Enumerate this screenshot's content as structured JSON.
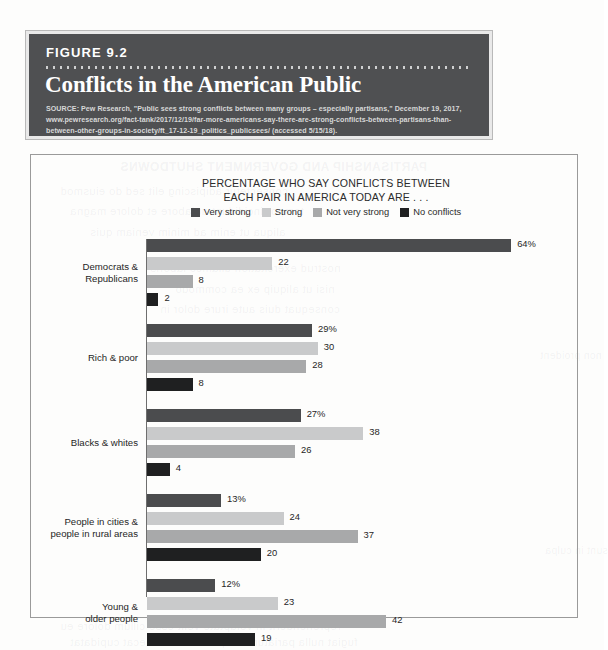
{
  "figure": {
    "number": "FIGURE 9.2",
    "title": "Conflicts in the American Public",
    "source": "SOURCE: Pew Research, \"Public sees strong conflicts between many groups – especially partisans,\" December 19, 2017, www.pewresearch.org/fact-tank/2017/12/19/far-more-americans-say-there-are-strong-conflicts-between-partisans-than-between-other-groups-in-society/ft_17-12-19_politics_publicsees/ (accessed 5/15/18)."
  },
  "chart_data": {
    "type": "bar",
    "orientation": "horizontal",
    "title": "PERCENTAGE WHO SAY CONFLICTS BETWEEN EACH PAIR IN AMERICA TODAY ARE . . .",
    "title_line1": "PERCENTAGE WHO SAY CONFLICTS BETWEEN",
    "title_line2": "EACH PAIR IN AMERICA TODAY ARE . . .",
    "xlabel": "",
    "ylabel": "",
    "xlim": [
      0,
      64
    ],
    "grid": false,
    "legend_position": "top-center",
    "categories": [
      "Democrats & Republicans",
      "Rich & poor",
      "Blacks & whites",
      "People in cities & people in rural areas",
      "Young & older people"
    ],
    "category_lines": [
      [
        "Democrats &",
        "Republicans"
      ],
      [
        "Rich & poor"
      ],
      [
        "Blacks & whites"
      ],
      [
        "People in cities &",
        "people in rural areas"
      ],
      [
        "Young &",
        "older people"
      ]
    ],
    "series": [
      {
        "name": "Very strong",
        "color": "#4b4c4e",
        "values": [
          64,
          29,
          27,
          13,
          12
        ],
        "labels": [
          "64%",
          "29%",
          "27%",
          "13%",
          "12%"
        ]
      },
      {
        "name": "Strong",
        "color": "#c9cacb",
        "values": [
          22,
          30,
          38,
          24,
          23
        ],
        "labels": [
          "22",
          "30",
          "38",
          "24",
          "23"
        ]
      },
      {
        "name": "Not very strong",
        "color": "#a8a9aa",
        "values": [
          8,
          28,
          26,
          37,
          42
        ],
        "labels": [
          "8",
          "28",
          "26",
          "37",
          "42"
        ]
      },
      {
        "name": "No conflicts",
        "color": "#1f2021",
        "values": [
          2,
          8,
          4,
          20,
          19
        ],
        "labels": [
          "2",
          "8",
          "4",
          "20",
          "19"
        ]
      }
    ]
  },
  "ghost_text": {
    "a": "PARTISANSHIP AND GOVERNMENT SHUTDOWNS",
    "b": "consectetur adipiscing elit sed do eiusmod",
    "c": "tempor incididunt ut labore et dolore magna",
    "d": "aliqua ut enim ad minim veniam quis",
    "e": "nostrud exercitation ullamco laboris",
    "f": "nisi ut aliquip ex ea commodo",
    "g": "consequat duis aute irure dolor in",
    "h": "reprehenderit in voluptate velit esse cillum dolore eu",
    "i": "fugiat nulla pariatur excepteur sint occaecat cupidatat",
    "j": "non proident",
    "k": "sunt in culpa"
  }
}
